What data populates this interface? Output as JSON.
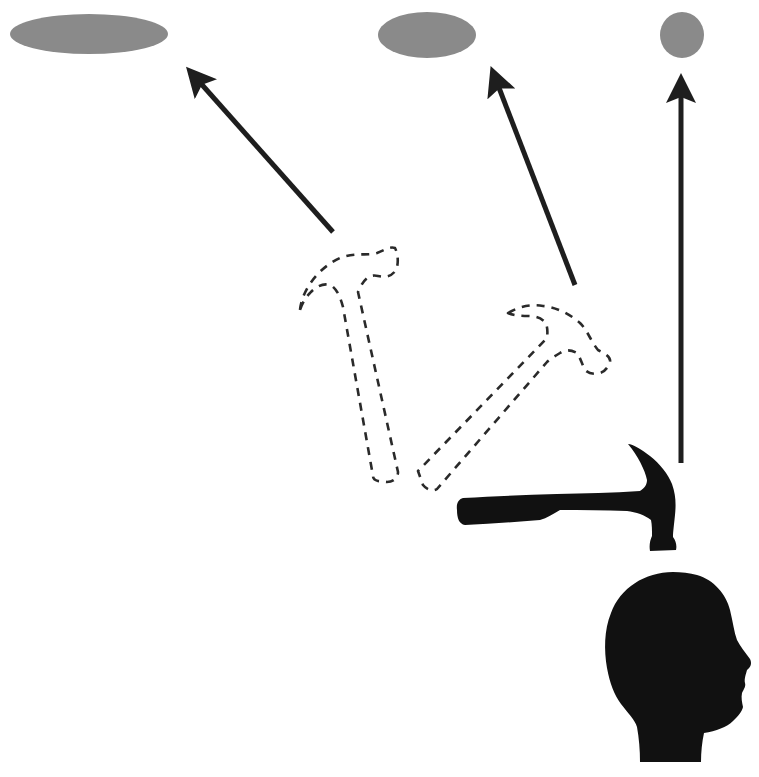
{
  "diagram": {
    "colors": {
      "target": "#8a8a8a",
      "arrow": "#1e1e1e",
      "silhouette": "#111111",
      "dashed_outline": "#2a2a2a",
      "background": "#ffffff"
    },
    "targets": [
      {
        "name": "target-wide",
        "cx": 89,
        "cy": 34,
        "rx": 79,
        "ry": 20
      },
      {
        "name": "target-medium",
        "cx": 427,
        "cy": 35,
        "rx": 49,
        "ry": 23
      },
      {
        "name": "target-narrow",
        "cx": 682,
        "cy": 35,
        "rx": 22,
        "ry": 23
      }
    ],
    "arrows": [
      {
        "name": "arrow-to-wide-target",
        "from": [
          333,
          232
        ],
        "to": [
          188,
          69
        ]
      },
      {
        "name": "arrow-to-medium-target",
        "from": [
          575,
          285
        ],
        "to": [
          492,
          69
        ]
      },
      {
        "name": "arrow-to-narrow-target",
        "from": [
          681,
          463
        ],
        "to": [
          681,
          76
        ]
      }
    ],
    "icons": {
      "hammer_ghost_1": "hammer-outline-icon",
      "hammer_ghost_2": "hammer-outline-icon",
      "hammer_solid": "hammer-icon",
      "head": "human-head-icon"
    }
  }
}
